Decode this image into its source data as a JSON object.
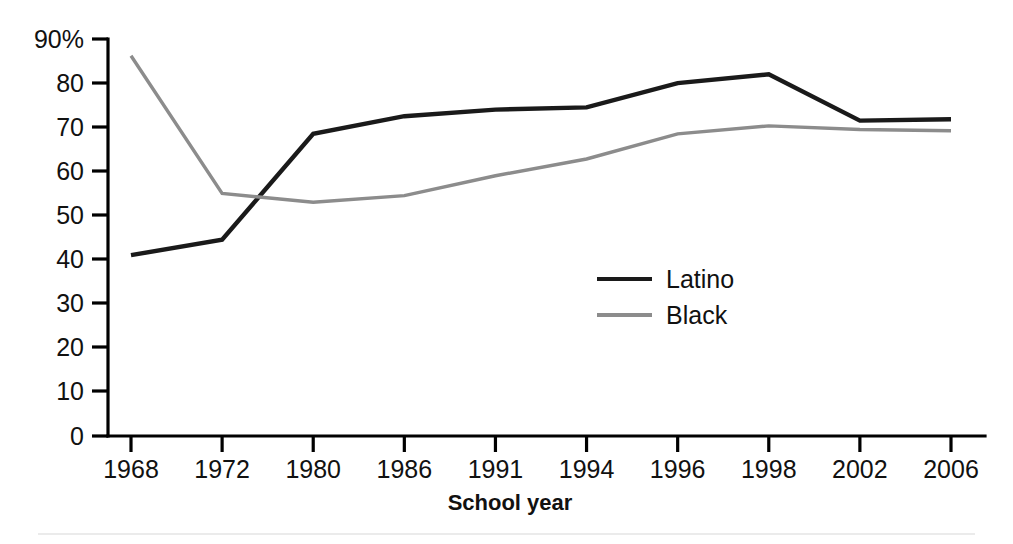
{
  "chart_data": {
    "type": "line",
    "title": "",
    "subtitle": "",
    "xlabel": "School year",
    "ylabel": "",
    "categories": [
      "1968",
      "1972",
      "1980",
      "1986",
      "1991",
      "1994",
      "1996",
      "1998",
      "2002",
      "2006"
    ],
    "x": [
      "1968",
      "1972",
      "1980",
      "1986",
      "1991",
      "1994",
      "1996",
      "1998",
      "2002",
      "2006"
    ],
    "series": [
      {
        "name": "Latino",
        "color": "#1a1a1a",
        "values": [
          41,
          44.5,
          68.5,
          72.5,
          74,
          74.5,
          80,
          82,
          71.5,
          71.8
        ]
      },
      {
        "name": "Black",
        "color": "#8c8c8c",
        "values": [
          86.2,
          55,
          53,
          54.5,
          59,
          62.8,
          68.5,
          70.3,
          69.5,
          69.2
        ]
      }
    ],
    "ylim": [
      0,
      90
    ],
    "yticks": [
      0,
      10,
      20,
      30,
      40,
      50,
      60,
      70,
      80,
      90
    ],
    "ytick_labels": [
      "0",
      "10",
      "20",
      "30",
      "40",
      "50",
      "60",
      "70",
      "80",
      "90%"
    ],
    "grid": false,
    "legend_position": "inside-center",
    "legend": [
      "Latino",
      "Black"
    ]
  },
  "axes": {
    "x_title": "School year",
    "y_unit_suffix": "%"
  },
  "legend": {
    "items": [
      {
        "label": "Latino",
        "color": "#1a1a1a"
      },
      {
        "label": "Black",
        "color": "#8c8c8c"
      }
    ]
  },
  "colors": {
    "latino": "#1a1a1a",
    "black": "#8c8c8c",
    "axis": "#000000",
    "background": "#ffffff",
    "footer_rule": "#ebebeb"
  }
}
